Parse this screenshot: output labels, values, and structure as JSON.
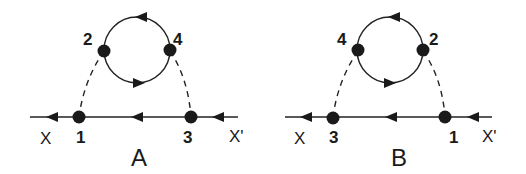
{
  "diagrams": [
    {
      "id": "A",
      "title": "A",
      "external_left": "X",
      "external_right": "X'",
      "vertices": {
        "top_left": "2",
        "top_right": "4",
        "bottom_left": "1",
        "bottom_right": "3"
      },
      "line_arrow_direction": "left",
      "loop_top_arrow_direction": "left",
      "loop_bottom_arrow_direction": "right"
    },
    {
      "id": "B",
      "title": "B",
      "external_left": "X",
      "external_right": "X'",
      "vertices": {
        "top_left": "4",
        "top_right": "2",
        "bottom_left": "3",
        "bottom_right": "1"
      },
      "line_arrow_direction": "left",
      "loop_top_arrow_direction": "left",
      "loop_bottom_arrow_direction": "right"
    }
  ],
  "colors": {
    "line": "#222222",
    "vertex": "#1a1a1a",
    "background": "#ffffff"
  }
}
